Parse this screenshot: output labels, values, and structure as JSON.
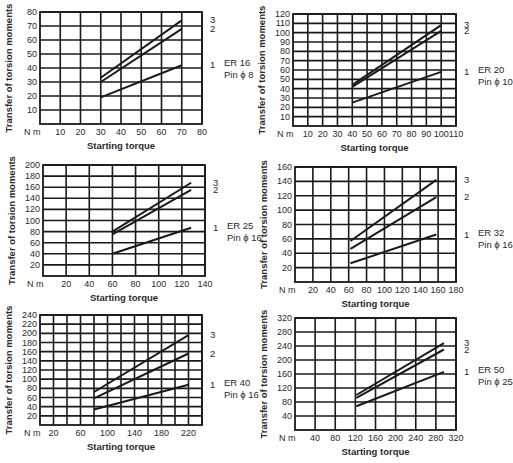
{
  "figure": {
    "common": {
      "ylabel": "Transfer of torsion moments",
      "xlabel": "Starting torque",
      "unit_label": "N m"
    }
  },
  "chart_data": [
    {
      "type": "line",
      "title": "ER 16",
      "subtitle": "Pin ϕ 8",
      "xlabel": "Starting torque",
      "ylabel": "Transfer of torsion moments",
      "unit": "N m",
      "xlim": [
        0,
        80
      ],
      "ylim": [
        0,
        80
      ],
      "xticks": [
        10,
        20,
        30,
        40,
        50,
        60,
        70,
        80
      ],
      "yticks": [
        10,
        20,
        30,
        40,
        50,
        60,
        70,
        80
      ],
      "xgrid": [
        10,
        20,
        30,
        40,
        50,
        60,
        70,
        80
      ],
      "ygrid": [
        10,
        20,
        30,
        40,
        50,
        60,
        70,
        80
      ],
      "grid": true,
      "series": [
        {
          "name": "3",
          "x": [
            30,
            70
          ],
          "y": [
            33,
            74
          ]
        },
        {
          "name": "2",
          "x": [
            30,
            70
          ],
          "y": [
            30,
            68
          ]
        },
        {
          "name": "1",
          "x": [
            30,
            70
          ],
          "y": [
            19,
            42
          ]
        }
      ],
      "frame": {
        "left": 40,
        "top": 12,
        "right": 202,
        "bottom": 124
      }
    },
    {
      "type": "line",
      "title": "ER 20",
      "subtitle": "Pin ϕ 10",
      "xlabel": "Starting torque",
      "ylabel": "Transfer of torsion moments",
      "unit": "N m",
      "xlim": [
        0,
        110
      ],
      "ylim": [
        0,
        120
      ],
      "xticks": [
        10,
        20,
        30,
        40,
        50,
        60,
        70,
        80,
        90,
        100,
        110
      ],
      "yticks": [
        10,
        20,
        30,
        40,
        50,
        60,
        70,
        80,
        90,
        100,
        110,
        120
      ],
      "xgrid": [
        10,
        20,
        30,
        40,
        50,
        60,
        70,
        80,
        90,
        100,
        110
      ],
      "ygrid": [
        10,
        20,
        30,
        40,
        50,
        60,
        70,
        80,
        90,
        100,
        110,
        120
      ],
      "grid": true,
      "series": [
        {
          "name": "3",
          "x": [
            40,
            100
          ],
          "y": [
            44,
            108
          ]
        },
        {
          "name": "2",
          "x": [
            40,
            100
          ],
          "y": [
            42,
            102
          ]
        },
        {
          "name": "1",
          "x": [
            40,
            100
          ],
          "y": [
            25,
            58
          ]
        }
      ],
      "frame": {
        "left": 293,
        "top": 14,
        "right": 456,
        "bottom": 126
      }
    },
    {
      "type": "line",
      "title": "ER 25",
      "subtitle": "Pin ϕ 16",
      "xlabel": "Starting torque",
      "ylabel": "Transfer of torsion moments",
      "unit": "N m",
      "xlim": [
        0,
        140
      ],
      "ylim": [
        0,
        200
      ],
      "xticks": [
        20,
        40,
        60,
        80,
        100,
        120,
        140
      ],
      "yticks": [
        20,
        40,
        60,
        80,
        100,
        120,
        140,
        160,
        180,
        200
      ],
      "xgrid": [
        20,
        40,
        60,
        80,
        100,
        120,
        140
      ],
      "ygrid": [
        20,
        40,
        60,
        80,
        100,
        120,
        140,
        160,
        180,
        200
      ],
      "grid": true,
      "series": [
        {
          "name": "3",
          "x": [
            60,
            128
          ],
          "y": [
            80,
            168
          ]
        },
        {
          "name": "2",
          "x": [
            60,
            128
          ],
          "y": [
            75,
            155
          ]
        },
        {
          "name": "1",
          "x": [
            60,
            128
          ],
          "y": [
            40,
            87
          ]
        }
      ],
      "frame": {
        "left": 43,
        "top": 165,
        "right": 205,
        "bottom": 276
      }
    },
    {
      "type": "line",
      "title": "ER 32",
      "subtitle": "Pin ϕ 16",
      "xlabel": "Starting torque",
      "ylabel": "Transfer of torsion moments",
      "unit": "N m",
      "xlim": [
        0,
        180
      ],
      "ylim": [
        0,
        160
      ],
      "xticks": [
        20,
        40,
        60,
        80,
        100,
        120,
        140,
        160,
        180
      ],
      "yticks": [
        20,
        40,
        60,
        80,
        100,
        120,
        140,
        160
      ],
      "xgrid": [
        20,
        40,
        60,
        80,
        100,
        120,
        140,
        160,
        180
      ],
      "ygrid": [
        20,
        40,
        60,
        80,
        100,
        120,
        140,
        160
      ],
      "grid": true,
      "series": [
        {
          "name": "3",
          "x": [
            62,
            158
          ],
          "y": [
            57,
            142
          ]
        },
        {
          "name": "2",
          "x": [
            62,
            158
          ],
          "y": [
            46,
            118
          ]
        },
        {
          "name": "1",
          "x": [
            62,
            158
          ],
          "y": [
            26,
            66
          ]
        }
      ],
      "frame": {
        "left": 295,
        "top": 167,
        "right": 456,
        "bottom": 282
      }
    },
    {
      "type": "line",
      "title": "ER 40",
      "subtitle": "Pin ϕ 16",
      "xlabel": "Starting torque",
      "ylabel": "Transfer of torsion moments",
      "unit": "N m",
      "xlim": [
        0,
        240
      ],
      "ylim": [
        0,
        240
      ],
      "xticks": [
        20,
        60,
        100,
        140,
        180,
        220
      ],
      "yticks": [
        20,
        40,
        60,
        80,
        100,
        120,
        140,
        160,
        180,
        200,
        220,
        240
      ],
      "xgrid": [
        20,
        40,
        60,
        80,
        100,
        120,
        140,
        160,
        180,
        200,
        220,
        240
      ],
      "ygrid": [
        20,
        40,
        60,
        80,
        100,
        120,
        140,
        160,
        180,
        200,
        220,
        240
      ],
      "grid": true,
      "series": [
        {
          "name": "3",
          "x": [
            80,
            220
          ],
          "y": [
            72,
            196
          ]
        },
        {
          "name": "2",
          "x": [
            80,
            220
          ],
          "y": [
            58,
            156
          ]
        },
        {
          "name": "1",
          "x": [
            80,
            220
          ],
          "y": [
            34,
            88
          ]
        }
      ],
      "frame": {
        "left": 40,
        "top": 315,
        "right": 202,
        "bottom": 425
      }
    },
    {
      "type": "line",
      "title": "ER 50",
      "subtitle": "Pin ϕ 25",
      "xlabel": "Starting torque",
      "ylabel": "Transfer of torsion moments",
      "unit": "N m",
      "xlim": [
        0,
        320
      ],
      "ylim": [
        0,
        320
      ],
      "xticks": [
        40,
        80,
        120,
        160,
        200,
        240,
        280,
        320
      ],
      "yticks": [
        40,
        80,
        120,
        160,
        200,
        240,
        280,
        320
      ],
      "xgrid": [
        40,
        80,
        120,
        160,
        200,
        240,
        280,
        320
      ],
      "ygrid": [
        40,
        80,
        120,
        160,
        200,
        240,
        280,
        320
      ],
      "grid": true,
      "series": [
        {
          "name": "3",
          "x": [
            122,
            296
          ],
          "y": [
            100,
            248
          ]
        },
        {
          "name": "2",
          "x": [
            122,
            296
          ],
          "y": [
            92,
            230
          ]
        },
        {
          "name": "1",
          "x": [
            122,
            296
          ],
          "y": [
            68,
            166
          ]
        }
      ],
      "frame": {
        "left": 295,
        "top": 318,
        "right": 456,
        "bottom": 430
      }
    }
  ],
  "colors": {
    "line": "#1a1a1a",
    "grid": "#1a1a1a",
    "text": "#2a2a2a",
    "background": "#ffffff"
  }
}
